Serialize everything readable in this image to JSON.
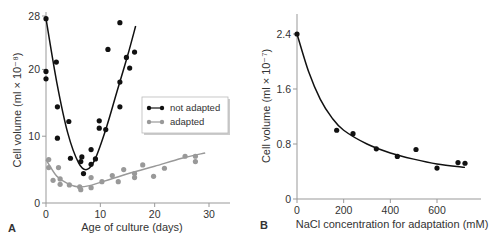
{
  "chart_data": [
    {
      "panel": "A",
      "type": "scatter",
      "xlabel": "Age of culture (days)",
      "ylabel": "Cell volume (ml × 10⁻⁸)",
      "xlim": [
        0,
        33
      ],
      "ylim": [
        0,
        28
      ],
      "xticks": [
        0,
        10,
        20,
        30
      ],
      "yticks": [
        0,
        10,
        20,
        28
      ],
      "legend_position": "right-middle",
      "grid": false,
      "series": [
        {
          "name": "not adapted",
          "color": "#111111",
          "points": [
            [
              0,
              27.6
            ],
            [
              0,
              19.7
            ],
            [
              0,
              18.6
            ],
            [
              1.9,
              21.1
            ],
            [
              2.1,
              14.4
            ],
            [
              2.1,
              9.7
            ],
            [
              4.2,
              12.2
            ],
            [
              4.5,
              6.7
            ],
            [
              6.4,
              6.2
            ],
            [
              6.6,
              6.9
            ],
            [
              6.9,
              4.4
            ],
            [
              8.3,
              5.8
            ],
            [
              8.3,
              8.0
            ],
            [
              9.1,
              6.6
            ],
            [
              9.8,
              12.3
            ],
            [
              9.8,
              11.2
            ],
            [
              11,
              11.0
            ],
            [
              11.4,
              23.0
            ],
            [
              13.6,
              27.0
            ],
            [
              13.6,
              18.1
            ],
            [
              13.6,
              14.4
            ],
            [
              14.8,
              21.8
            ],
            [
              15.4,
              20.2
            ],
            [
              16.3,
              22.6
            ]
          ],
          "fit": [
            [
              0,
              27.6
            ],
            [
              2,
              18
            ],
            [
              4,
              10.5
            ],
            [
              6,
              6
            ],
            [
              7.5,
              5
            ],
            [
              9,
              6.5
            ],
            [
              11,
              11
            ],
            [
              13,
              16.5
            ],
            [
              15,
              22
            ],
            [
              16.5,
              26.5
            ]
          ]
        },
        {
          "name": "adapted",
          "color": "#999999",
          "points": [
            [
              0.5,
              6.5
            ],
            [
              0.5,
              5.3
            ],
            [
              1.3,
              3.4
            ],
            [
              2.3,
              5.3
            ],
            [
              2.6,
              3.6
            ],
            [
              2.6,
              2.8
            ],
            [
              4.3,
              2.7
            ],
            [
              6.2,
              2.4
            ],
            [
              6.4,
              2.0
            ],
            [
              8.3,
              3.8
            ],
            [
              8.3,
              2.3
            ],
            [
              10.3,
              3.2
            ],
            [
              12.2,
              4.1
            ],
            [
              13.3,
              3.2
            ],
            [
              14.3,
              5.0
            ],
            [
              16.3,
              4.4
            ],
            [
              16.3,
              3.8
            ],
            [
              17.8,
              5.7
            ],
            [
              19.8,
              4.0
            ],
            [
              21.8,
              5.2
            ],
            [
              25.6,
              7.0
            ],
            [
              27.5,
              7.0
            ],
            [
              27.5,
              6.2
            ]
          ],
          "fit": [
            [
              0,
              6.5
            ],
            [
              2,
              4
            ],
            [
              4,
              2.9
            ],
            [
              6,
              2.4
            ],
            [
              8,
              2.6
            ],
            [
              12,
              3.6
            ],
            [
              16,
              4.6
            ],
            [
              20,
              5.5
            ],
            [
              25,
              6.7
            ],
            [
              29.3,
              7.5
            ]
          ]
        }
      ]
    },
    {
      "panel": "B",
      "type": "scatter",
      "xlabel": "NaCl concentration for adaptation (mM)",
      "ylabel": "Cell volume (ml × 10⁻⁷)",
      "xlim": [
        0,
        780
      ],
      "ylim": [
        0,
        2.7
      ],
      "xticks": [
        0,
        200,
        400,
        600
      ],
      "yticks": [
        0,
        0.8,
        1.6,
        2.4
      ],
      "grid": false,
      "series": [
        {
          "name": "cell volume",
          "color": "#111111",
          "points": [
            [
              0,
              2.4
            ],
            [
              170,
              1.0
            ],
            [
              240,
              0.95
            ],
            [
              340,
              0.73
            ],
            [
              430,
              0.62
            ],
            [
              510,
              0.72
            ],
            [
              600,
              0.45
            ],
            [
              690,
              0.53
            ],
            [
              720,
              0.52
            ]
          ],
          "fit": [
            [
              0,
              2.4
            ],
            [
              50,
              1.85
            ],
            [
              100,
              1.45
            ],
            [
              150,
              1.18
            ],
            [
              200,
              1.0
            ],
            [
              300,
              0.8
            ],
            [
              400,
              0.67
            ],
            [
              500,
              0.58
            ],
            [
              600,
              0.51
            ],
            [
              720,
              0.46
            ]
          ]
        }
      ]
    }
  ],
  "labels": {
    "panelA": "A",
    "panelB": "B",
    "legend_not_adapted": "not adapted",
    "legend_adapted": "adapted"
  }
}
